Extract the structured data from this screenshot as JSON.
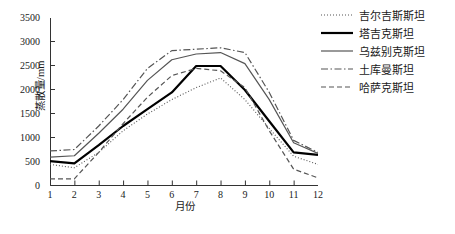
{
  "chart_data": {
    "type": "line",
    "title": "",
    "xlabel": "月份",
    "ylabel": "蒸散量/mm",
    "categories": [
      1,
      2,
      3,
      4,
      5,
      6,
      7,
      8,
      9,
      10,
      11,
      12
    ],
    "x_tick_labels": [
      "1",
      "2",
      "3",
      "4",
      "5",
      "6",
      "7",
      "8",
      "9",
      "10",
      "11",
      "12"
    ],
    "y_tick_labels": [
      "0",
      "500",
      "1000",
      "1500",
      "2000",
      "2500",
      "3000",
      "3500"
    ],
    "y_tick_values": [
      0,
      500,
      1000,
      1500,
      2000,
      2500,
      3000,
      3500
    ],
    "ylim": [
      0,
      3500
    ],
    "xlim": [
      1,
      12
    ],
    "grid": false,
    "legend_position": "top-right",
    "series": [
      {
        "name": "吉尔吉斯斯坦",
        "style": "dotted",
        "color": "#555555",
        "width": 1.1,
        "values": [
          450,
          380,
          700,
          1150,
          1500,
          1800,
          2050,
          2250,
          1800,
          1200,
          620,
          450
        ]
      },
      {
        "name": "塔吉克斯坦",
        "style": "solid-thick",
        "color": "#000000",
        "width": 2.2,
        "values": [
          520,
          470,
          850,
          1250,
          1600,
          1950,
          2500,
          2500,
          2000,
          1350,
          700,
          650
        ]
      },
      {
        "name": "乌兹别克斯坦",
        "style": "solid",
        "color": "#555555",
        "width": 1.2,
        "values": [
          600,
          630,
          1100,
          1600,
          2200,
          2630,
          2750,
          2780,
          2550,
          1800,
          900,
          680
        ]
      },
      {
        "name": "土库曼斯坦",
        "style": "dashdot",
        "color": "#555555",
        "width": 1.2,
        "values": [
          730,
          760,
          1250,
          1800,
          2450,
          2820,
          2850,
          2880,
          2780,
          1950,
          950,
          700
        ]
      },
      {
        "name": "哈萨克斯坦",
        "style": "dashed",
        "color": "#555555",
        "width": 1.2,
        "values": [
          150,
          150,
          700,
          1300,
          1850,
          2300,
          2450,
          2400,
          2050,
          1150,
          350,
          170
        ]
      }
    ]
  },
  "legend": {
    "items": [
      {
        "label": "吉尔吉斯斯坦"
      },
      {
        "label": "塔吉克斯坦"
      },
      {
        "label": "乌兹别克斯坦"
      },
      {
        "label": "土库曼斯坦"
      },
      {
        "label": "哈萨克斯坦"
      }
    ]
  }
}
